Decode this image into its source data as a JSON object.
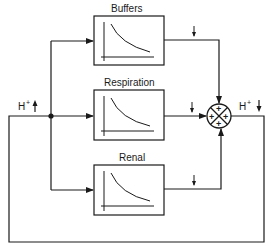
{
  "diagram": {
    "type": "feedback-control-block-diagram",
    "blocks": [
      {
        "id": "buffers",
        "label": "Buffers"
      },
      {
        "id": "respiration",
        "label": "Respiration"
      },
      {
        "id": "renal",
        "label": "Renal"
      }
    ],
    "input_label": {
      "base": "H",
      "sup": "+",
      "direction": "up-arrow"
    },
    "output_label": {
      "base": "H",
      "sup": "+",
      "direction": "down-arrow"
    },
    "summing_junction": {
      "signs": [
        "+",
        "+",
        "+",
        "+"
      ]
    },
    "edges": [
      {
        "from": "input",
        "to": "buffers"
      },
      {
        "from": "input",
        "to": "respiration"
      },
      {
        "from": "input",
        "to": "renal"
      },
      {
        "from": "buffers",
        "to": "summing_junction",
        "annotation": "down-arrow"
      },
      {
        "from": "respiration",
        "to": "summing_junction",
        "annotation": "down-arrow"
      },
      {
        "from": "renal",
        "to": "summing_junction",
        "annotation": "down-arrow"
      },
      {
        "from": "summing_junction",
        "to": "input",
        "type": "feedback"
      }
    ],
    "colors": {
      "stroke": "#1a1a1a",
      "background": "#ffffff"
    }
  }
}
